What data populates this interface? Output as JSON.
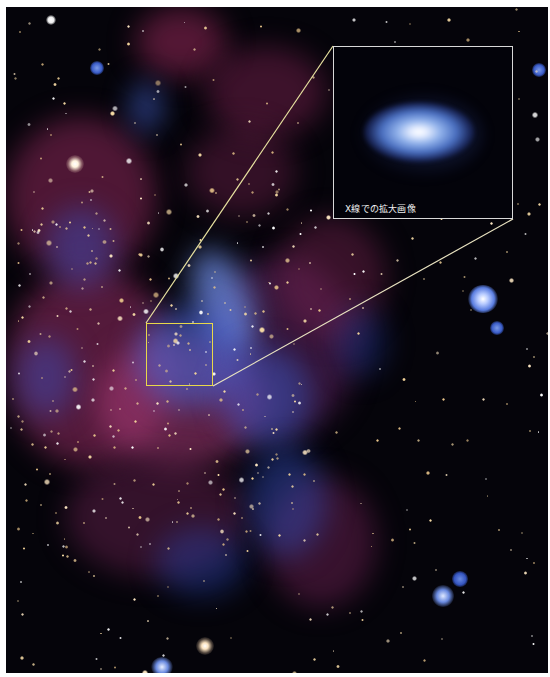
{
  "image": {
    "subject": "galactic-center-composite",
    "colors": {
      "background": "#05040a",
      "dust_magenta": "#a0306a",
      "xray_blue": "#3c5bd0",
      "star_gold": "#f3d49a",
      "zoom_box": "#e8d84a",
      "inset_border": "#d8d8d8"
    }
  },
  "inset": {
    "caption": "X線での拡大画像"
  }
}
